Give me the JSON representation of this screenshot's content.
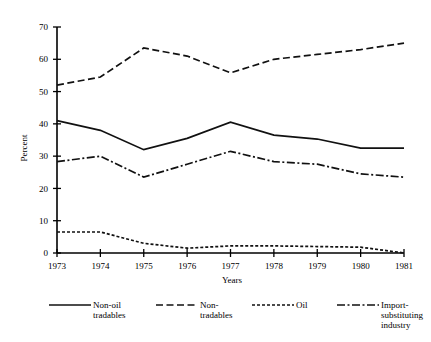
{
  "chart_data": {
    "type": "line",
    "title": "",
    "xlabel": "Years",
    "ylabel": "Percent",
    "categories": [
      "1973",
      "1974",
      "1975",
      "1976",
      "1977",
      "1978",
      "1979",
      "1980",
      "1981"
    ],
    "x": [
      1973,
      1974,
      1975,
      1976,
      1977,
      1978,
      1979,
      1980,
      1981
    ],
    "xlim": [
      1973,
      1981
    ],
    "ylim": [
      0,
      70
    ],
    "yticks": [
      0,
      10,
      20,
      30,
      40,
      50,
      60,
      70
    ],
    "ytick_labels": [
      "0",
      "10",
      "20",
      "30",
      "40",
      "50",
      "60",
      "70"
    ],
    "grid": false,
    "legend_position": "below",
    "series": [
      {
        "name": "Non-oil tradables",
        "label_lines": [
          "Non-oil",
          "tradables"
        ],
        "line_style": "solid",
        "dasharray": "",
        "values": [
          41.0,
          38.0,
          32.0,
          35.5,
          40.5,
          36.5,
          35.3,
          32.5,
          32.5
        ]
      },
      {
        "name": "Non-tradables",
        "label_lines": [
          "Non-",
          "tradables"
        ],
        "line_style": "dashed",
        "dasharray": "7,3.5",
        "values": [
          52.0,
          54.5,
          63.5,
          61.0,
          55.8,
          60.0,
          61.5,
          63.0,
          65.0
        ]
      },
      {
        "name": "Oil",
        "label_lines": [
          "Oil"
        ],
        "line_style": "dotted",
        "dasharray": "3,2",
        "values": [
          6.5,
          6.5,
          3.0,
          1.5,
          2.2,
          2.2,
          2.0,
          1.8,
          0.0
        ]
      },
      {
        "name": "Import-substituting industry",
        "label_lines": [
          "Import-",
          "substituting",
          "industry"
        ],
        "line_style": "dash-dot",
        "dasharray": "8,2.5,2,2.5",
        "values": [
          28.3,
          30.0,
          23.5,
          27.5,
          31.5,
          28.3,
          27.5,
          24.5,
          23.5
        ]
      }
    ]
  },
  "axes": {
    "y_axis_title": "Percent",
    "x_axis_title": "Years"
  },
  "colors": {
    "line": "#111111",
    "axis": "#000000",
    "background": "#ffffff"
  }
}
